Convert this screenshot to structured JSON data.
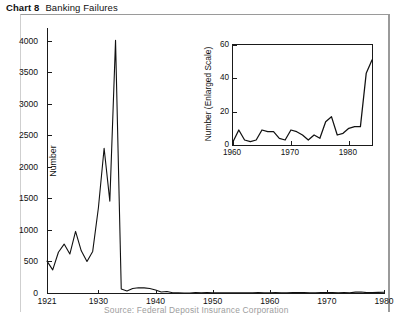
{
  "title": {
    "number": "Chart 8",
    "text": "Banking Failures"
  },
  "caption": "Source: Federal Deposit Insurance Corporation",
  "colors": {
    "series": "#111111",
    "axis": "#1a1a1a",
    "frame": "#9a9a9a",
    "background": "#ffffff"
  },
  "chart_data": [
    {
      "type": "line",
      "id": "main",
      "title": "Banking Failures",
      "xlabel": "",
      "ylabel": "Number",
      "xlim": [
        1921,
        1980
      ],
      "ylim": [
        0,
        4200
      ],
      "grid": false,
      "legend": "none",
      "xticks": [
        1921,
        1930,
        1940,
        1950,
        1960,
        1970,
        1980
      ],
      "xtick_labels": [
        "1921",
        "1930",
        "1940",
        "1950",
        "1960",
        "1970",
        "1980"
      ],
      "yticks": [
        0,
        500,
        1000,
        1500,
        2000,
        2500,
        3000,
        3500,
        4000
      ],
      "ytick_labels": [
        "0",
        "500",
        "1000",
        "1500",
        "2000",
        "2500",
        "3000",
        "3500",
        "4000"
      ],
      "x": [
        1921,
        1922,
        1923,
        1924,
        1925,
        1926,
        1927,
        1928,
        1929,
        1930,
        1931,
        1932,
        1933,
        1934,
        1935,
        1936,
        1937,
        1938,
        1939,
        1940,
        1941,
        1942,
        1943,
        1944,
        1945,
        1946,
        1947,
        1948,
        1949,
        1950,
        1951,
        1952,
        1953,
        1954,
        1955,
        1956,
        1957,
        1958,
        1959,
        1960,
        1961,
        1962,
        1963,
        1964,
        1965,
        1966,
        1967,
        1968,
        1969,
        1970,
        1971,
        1972,
        1973,
        1974,
        1975,
        1976,
        1977,
        1978,
        1979,
        1980
      ],
      "values": [
        505,
        367,
        646,
        775,
        618,
        976,
        669,
        499,
        659,
        1352,
        2294,
        1456,
        4004,
        62,
        32,
        72,
        84,
        81,
        72,
        48,
        17,
        23,
        5,
        2,
        1,
        1,
        6,
        3,
        9,
        5,
        5,
        4,
        5,
        4,
        5,
        3,
        3,
        9,
        3,
        2,
        9,
        3,
        2,
        8,
        9,
        8,
        4,
        3,
        9,
        8,
        6,
        3,
        6,
        4,
        14,
        17,
        6,
        7,
        10,
        11
      ]
    },
    {
      "type": "line",
      "id": "inset",
      "title": "",
      "xlabel": "",
      "ylabel": "Number (Enlarged Scale)",
      "xlim": [
        1960,
        1984
      ],
      "ylim": [
        0,
        60
      ],
      "grid": false,
      "legend": "none",
      "xticks": [
        1960,
        1970,
        1980
      ],
      "xtick_labels": [
        "1960",
        "1970",
        "1980"
      ],
      "yticks": [
        0,
        20,
        40,
        60
      ],
      "ytick_labels": [
        "0",
        "20",
        "40",
        "60"
      ],
      "x": [
        1960,
        1961,
        1962,
        1963,
        1964,
        1965,
        1966,
        1967,
        1968,
        1969,
        1970,
        1971,
        1972,
        1973,
        1974,
        1975,
        1976,
        1977,
        1978,
        1979,
        1980,
        1981,
        1982,
        1983,
        1984
      ],
      "values": [
        2,
        9,
        3,
        2,
        3,
        9,
        8,
        8,
        4,
        3,
        9,
        8,
        6,
        3,
        6,
        4,
        14,
        17,
        6,
        7,
        10,
        11,
        11,
        43,
        51
      ]
    }
  ]
}
